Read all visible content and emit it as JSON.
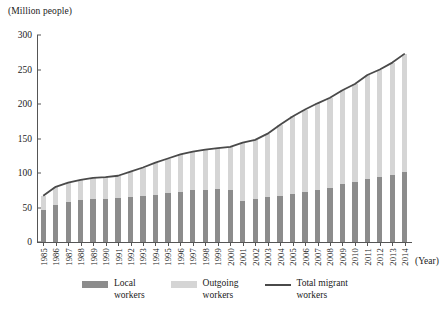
{
  "chart_data": {
    "type": "bar",
    "title": "",
    "subtitle": "",
    "unit_label": "(Million people)",
    "xlabel": "(Year)",
    "ylabel": "",
    "ylim": [
      0,
      300
    ],
    "ytick_values": [
      0,
      50,
      100,
      150,
      200,
      250,
      300
    ],
    "grid": false,
    "stacked": true,
    "legend_position": "bottom",
    "categories": [
      "1985",
      "1986",
      "1987",
      "1988",
      "1989",
      "1990",
      "1991",
      "1992",
      "1993",
      "1994",
      "1995",
      "1996",
      "1997",
      "1998",
      "1999",
      "2000",
      "2001",
      "2002",
      "2003",
      "2004",
      "2005",
      "2006",
      "2007",
      "2008",
      "2009",
      "2010",
      "2011",
      "2012",
      "2013",
      "2014"
    ],
    "series": [
      {
        "name": "Local workers",
        "color": "#8c8c8c",
        "type": "bar",
        "values": [
          47,
          54,
          58,
          61,
          62,
          63,
          64,
          65,
          66,
          68,
          71,
          73,
          75,
          76,
          77,
          76,
          60,
          62,
          65,
          67,
          70,
          73,
          75,
          78,
          84,
          87,
          91,
          94,
          97,
          101
        ]
      },
      {
        "name": "Outgoing workers",
        "color": "#d5d5d5",
        "type": "bar",
        "values": [
          20,
          26,
          28,
          29,
          31,
          31,
          32,
          37,
          42,
          47,
          50,
          54,
          56,
          58,
          59,
          62,
          84,
          86,
          92,
          103,
          112,
          119,
          126,
          131,
          136,
          142,
          151,
          156,
          163,
          172
        ]
      },
      {
        "name": "Total migrant workers",
        "color": "#4a4a4a",
        "type": "line",
        "values": [
          67,
          80,
          86,
          90,
          93,
          94,
          96,
          102,
          108,
          115,
          121,
          127,
          131,
          134,
          136,
          138,
          144,
          148,
          157,
          170,
          182,
          192,
          201,
          209,
          220,
          229,
          242,
          250,
          260,
          273
        ]
      }
    ]
  },
  "legend": {
    "items": [
      {
        "label_line1": "Local",
        "label_line2": "workers",
        "swatch": "dark-gray-bar"
      },
      {
        "label_line1": "Outgoing",
        "label_line2": "workers",
        "swatch": "light-gray-bar"
      },
      {
        "label_line1": "Total migrant",
        "label_line2": "workers",
        "swatch": "dark-line"
      }
    ]
  },
  "colors": {
    "local": "#8c8c8c",
    "outgoing": "#d5d5d5",
    "total_line": "#4a4a4a",
    "axis": "#555555",
    "text": "#1a1a1a"
  }
}
